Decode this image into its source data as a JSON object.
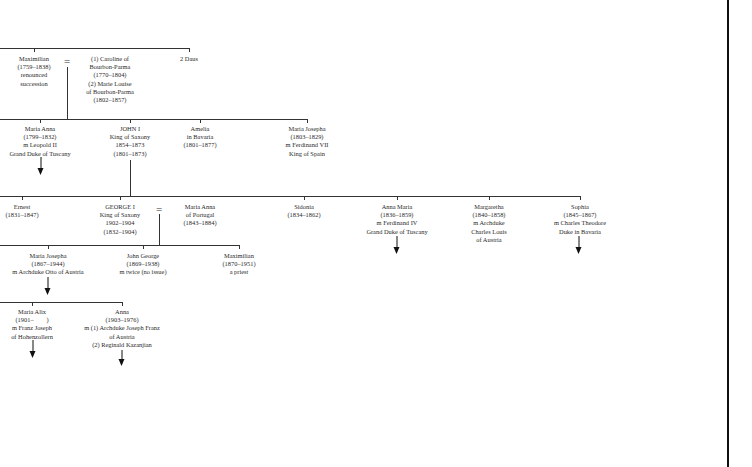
{
  "tree": {
    "gen1": {
      "maximilian": [
        "Maximilian",
        "(1759–1838)",
        "renounced",
        "succession"
      ],
      "equals": "=",
      "spouses": [
        "(1) Caroline of",
        "Bourbon-Parma",
        "(1770–1804)",
        "(2) Marie Louise",
        "of Bourbon-Parma",
        "(1802–1857)"
      ],
      "daus": [
        "2 Daus"
      ]
    },
    "gen2": {
      "maria_anna": [
        "Maria Anna",
        "(1799–1832)",
        "m Leopold II",
        "Grand Duke of Tuscany"
      ],
      "john": [
        "JOHN I",
        "King of Saxony",
        "1854–1873",
        "(1801–1873)"
      ],
      "amelia": [
        "Amelia",
        "in Bavaria",
        "(1801–1877)"
      ],
      "maria_josepha": [
        "Maria Josepha",
        "(1803–1829)",
        "m Ferdinand VII",
        "King of Spain"
      ]
    },
    "gen3": {
      "ernest": [
        "Ernest",
        "(1831–1847)"
      ],
      "george": [
        "GEORGE I",
        "King of Saxony",
        "1902–1904",
        "(1832–1904)"
      ],
      "equals": "=",
      "maria_anna_portugal": [
        "Maria Anna",
        "of Portugal",
        "(1843–1884)"
      ],
      "sidonia": [
        "Sidonia",
        "(1834–1862)"
      ],
      "anna_maria": [
        "Anna Maria",
        "(1836–1859)",
        "m Ferdinand IV",
        "Grand Duke of Tuscany"
      ],
      "margaretha": [
        "Margaretha",
        "(1840–1858)",
        "m Archduke",
        "Charles Louis",
        "of Austria"
      ],
      "sophia": [
        "Sophia",
        "(1845–1867)",
        "m Charles Theodore",
        "Duke in Bavaria"
      ]
    },
    "gen4": {
      "maria_josepha": [
        "Maria Josepha",
        "(1867–1944)",
        "m Archduke Otto of Austria"
      ],
      "john_george": [
        "John George",
        "(1869–1938)",
        "m twice (no issue)"
      ],
      "maximilian": [
        "Maximilian",
        "(1870–1951)",
        "a priest"
      ]
    },
    "gen5": {
      "maria_alix": [
        "Maria Alix",
        "(1901–        )",
        "m Franz Joseph",
        "of Hohenzollern"
      ],
      "anna": [
        "Anna",
        "(1903–1976)",
        "m (1) Archduke Joseph Franz",
        "of Austria",
        "(2) Reginald Kazanjian"
      ]
    }
  },
  "colors": {
    "line": "#333333",
    "text": "#2a2a2a",
    "background": "#ffffff"
  }
}
